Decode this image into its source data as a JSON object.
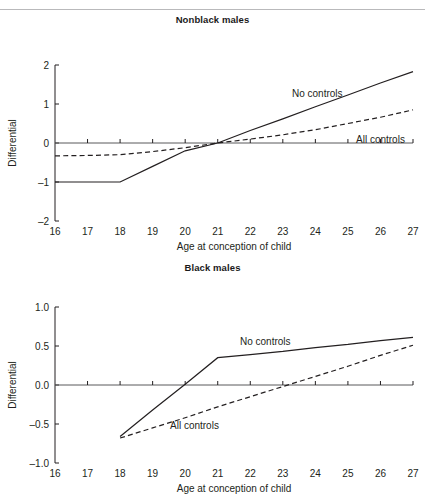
{
  "figure": {
    "rule_top": true,
    "x_axis_title": "Age at conception of child",
    "y_axis_title": "Differential"
  },
  "panels": [
    {
      "id": "nonblack",
      "title": "Nonblack males",
      "series_labels": {
        "no_controls": "No controls",
        "all_controls": "All controls"
      },
      "x_ticks": [
        "16",
        "17",
        "18",
        "19",
        "20",
        "21",
        "22",
        "23",
        "24",
        "25",
        "26",
        "27"
      ],
      "y_ticks": [
        "2",
        "1",
        "0",
        "–1",
        "–2"
      ]
    },
    {
      "id": "black",
      "title": "Black males",
      "series_labels": {
        "no_controls": "No controls",
        "all_controls": "All controls"
      },
      "x_ticks": [
        "16",
        "17",
        "18",
        "19",
        "20",
        "21",
        "22",
        "23",
        "24",
        "25",
        "26",
        "27"
      ],
      "y_ticks": [
        "1.0",
        "0.5",
        "0.0",
        "–0.5",
        "–1.0"
      ]
    }
  ],
  "chart_data": [
    {
      "type": "line",
      "title": "Nonblack males",
      "xlabel": "Age at conception of child",
      "ylabel": "Differential",
      "xlim": [
        16,
        27
      ],
      "ylim": [
        -2,
        2
      ],
      "xticks": [
        16,
        17,
        18,
        19,
        20,
        21,
        22,
        23,
        24,
        25,
        26,
        27
      ],
      "yticks": [
        -2,
        -1,
        0,
        1,
        2
      ],
      "grid": false,
      "zero_line": true,
      "legend": "inline-annotation",
      "series": [
        {
          "name": "No controls",
          "style": "solid",
          "x": [
            16,
            17,
            18,
            19,
            20,
            21,
            22,
            23,
            24,
            25,
            26,
            27
          ],
          "values": [
            -1.0,
            -1.0,
            -1.0,
            -0.6,
            -0.2,
            0.0,
            0.32,
            0.62,
            0.93,
            1.23,
            1.54,
            1.83
          ]
        },
        {
          "name": "All controls",
          "style": "dashed",
          "x": [
            16,
            17,
            18,
            19,
            20,
            21,
            22,
            23,
            24,
            25,
            26,
            27
          ],
          "values": [
            -0.33,
            -0.32,
            -0.3,
            -0.22,
            -0.12,
            0.0,
            0.1,
            0.21,
            0.34,
            0.5,
            0.66,
            0.85
          ]
        }
      ]
    },
    {
      "type": "line",
      "title": "Black males",
      "xlabel": "Age at conception of child",
      "ylabel": "Differential",
      "xlim": [
        16,
        27
      ],
      "ylim": [
        -1.0,
        1.0
      ],
      "xticks": [
        16,
        17,
        18,
        19,
        20,
        21,
        22,
        23,
        24,
        25,
        26,
        27
      ],
      "yticks": [
        -1.0,
        -0.5,
        0.0,
        0.5,
        1.0
      ],
      "grid": false,
      "zero_line": true,
      "legend": "inline-annotation",
      "series": [
        {
          "name": "No controls",
          "style": "solid",
          "x": [
            18,
            19,
            20,
            21,
            22,
            23,
            24,
            25,
            26,
            27
          ],
          "values": [
            -0.66,
            -0.32,
            0.01,
            0.35,
            0.39,
            0.43,
            0.48,
            0.52,
            0.57,
            0.61
          ]
        },
        {
          "name": "All controls",
          "style": "dashed",
          "x": [
            18,
            19,
            20,
            21,
            22,
            23,
            24,
            25,
            26,
            27
          ],
          "values": [
            -0.68,
            -0.55,
            -0.42,
            -0.28,
            -0.15,
            -0.02,
            0.11,
            0.24,
            0.38,
            0.51
          ]
        }
      ]
    }
  ]
}
